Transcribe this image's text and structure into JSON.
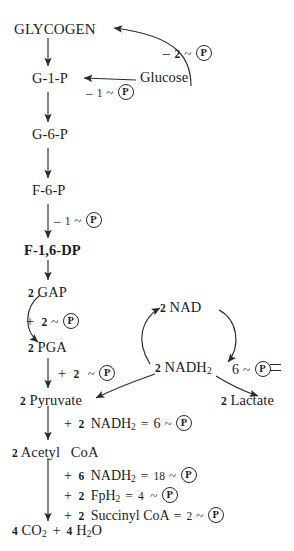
{
  "diagram": {
    "ink_color": "#2a2a2a",
    "background": "#ffffff",
    "phosphate_symbol": "P",
    "nodes": {
      "glycogen": "GLYCOGEN",
      "g1p": "G-1-P",
      "glucose": "Glucose",
      "g6p": "G-6-P",
      "f6p": "F-6-P",
      "f16dp": "F-1,6-DP",
      "gap_count": "2",
      "gap": "GAP",
      "pga_count": "2",
      "pga": "PGA",
      "pyruvate_count": "2",
      "pyruvate": "Pyruvate",
      "lactate_count": "2",
      "lactate": "Lactate",
      "nad_count": "2",
      "nad": "NAD",
      "nadh2_count": "2",
      "nadh2": "NADH",
      "nadh2_sub": "2",
      "acetyl_count": "2",
      "acetyl": "Acetyl",
      "coa": "CoA",
      "co2_count": "4",
      "co2": "CO",
      "co2_sub": "2",
      "plus": "+",
      "h2o_count": "4",
      "h2o": "H",
      "h2o_sub": "2",
      "h2o_tail": "O"
    },
    "costs": {
      "glycogen_from_glucose": {
        "sign": "–",
        "count": "2",
        "tilde": "~"
      },
      "g1p_from_glucose": {
        "sign": "–",
        "count": "1",
        "tilde": "~"
      },
      "f6p_to_f16dp": {
        "sign": "–",
        "count": "1",
        "tilde": "~"
      },
      "gap_to_pga": {
        "sign": "+",
        "count": "2",
        "tilde": "~"
      },
      "pga_to_pyruvate": {
        "sign": "+",
        "count": "2",
        "tilde": "~"
      },
      "nadh2_shuttle": {
        "count": "6",
        "tilde": "~"
      }
    },
    "equations": [
      {
        "sign": "+",
        "count": "2",
        "species": "NADH",
        "sub": "2",
        "equals": "=",
        "yield": "6",
        "tilde": "~"
      },
      {
        "sign": "+",
        "count": "6",
        "species": "NADH",
        "sub": "2",
        "equals": "=",
        "yield": "18",
        "tilde": "~"
      },
      {
        "sign": "+",
        "count": "2",
        "species": "FpH",
        "sub": "2",
        "equals": "=",
        "yield": "4",
        "tilde": "~"
      },
      {
        "sign": "+",
        "count": "2",
        "species": "Succinyl CoA",
        "sub": "",
        "equals": "=",
        "yield": "2",
        "tilde": "~"
      }
    ]
  }
}
